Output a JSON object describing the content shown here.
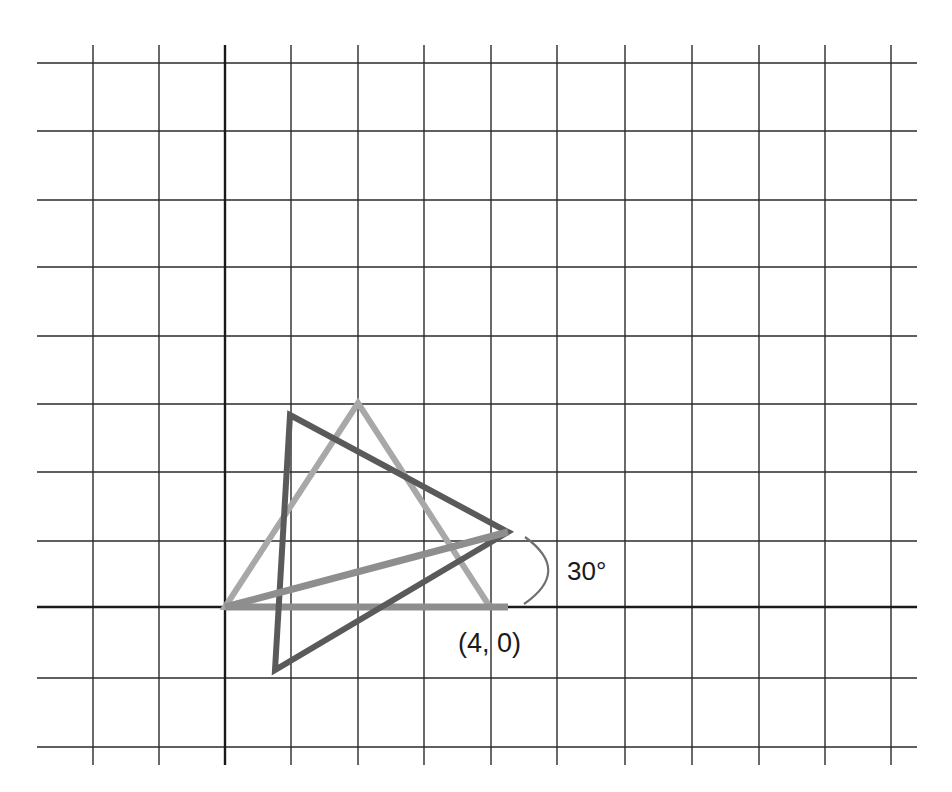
{
  "diagram": {
    "type": "coordinate-grid-rotation",
    "grid": {
      "x_lines": [
        93,
        159,
        225,
        291,
        358,
        424,
        491,
        557,
        625,
        692,
        759,
        825,
        891
      ],
      "y_lines": [
        63,
        131,
        200,
        267,
        336,
        404,
        472,
        541,
        610,
        678,
        747
      ],
      "x_axis_y": 607,
      "y_axis_x": 225,
      "h_extent": [
        37,
        917
      ],
      "v_extent": [
        45,
        765
      ],
      "line_color": "#2a2a2a"
    },
    "shapes": {
      "original_triangle": {
        "points": "225,607 358,403 490,607",
        "color": "#a8a8a8"
      },
      "rotated_triangle": {
        "points": "290,415 508,532 275,670",
        "color": "#5a5a5a"
      },
      "original_segment": {
        "points": "225,607 508,607",
        "color": "#8e8e8e"
      },
      "rotated_segment": {
        "points": "225,607 508,532",
        "color": "#8e8e8e"
      }
    },
    "angle_arc": {
      "path": "M 525 537 Q 572 571 524 604",
      "color": "#707070"
    },
    "labels": {
      "angle": "30°",
      "point": "(4, 0)"
    }
  }
}
